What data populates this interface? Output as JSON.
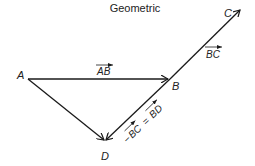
{
  "title": "Geometric",
  "points": {
    "A": "A",
    "B": "B",
    "C": "C",
    "D": "D"
  },
  "vectors": {
    "ab": "AB",
    "bc": "BC",
    "neg_bc_prefix": "−",
    "neg_bc": "BC",
    "equals": "=",
    "bd": "BD"
  }
}
